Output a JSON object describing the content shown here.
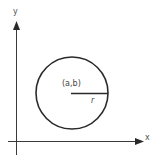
{
  "diagram": {
    "axes": {
      "x_label": "x",
      "y_label": "y"
    },
    "circle": {
      "center_label": "(a,b)",
      "radius_label": "r"
    },
    "colors": {
      "stroke": "#2a2a2a",
      "text": "#555555",
      "background": "#ffffff"
    }
  }
}
